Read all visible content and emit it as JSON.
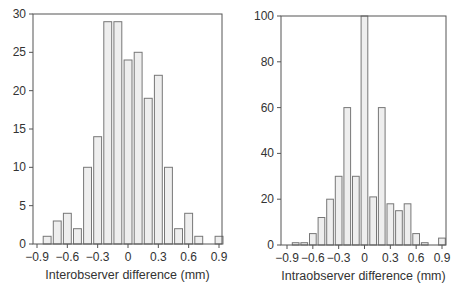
{
  "chart_data": [
    {
      "type": "bar",
      "title": "",
      "xlabel": "Interobserver difference (mm)",
      "ylabel": "",
      "ylim": [
        0,
        30
      ],
      "xlim": [
        -0.9,
        0.9
      ],
      "yticks": [
        0,
        5,
        10,
        15,
        20,
        25,
        30
      ],
      "xticks": [
        "-0.9",
        "-0.6",
        "-0.3",
        "0",
        "0.3",
        "0.6",
        "0.9"
      ],
      "categories": [
        -0.9,
        -0.8,
        -0.7,
        -0.6,
        -0.5,
        -0.4,
        -0.3,
        -0.2,
        -0.1,
        0,
        0.1,
        0.2,
        0.3,
        0.4,
        0.5,
        0.6,
        0.7,
        0.8,
        0.9
      ],
      "values": [
        0,
        1,
        3,
        4,
        2,
        10,
        14,
        29,
        29,
        24,
        25,
        19,
        22,
        10,
        2,
        4,
        1,
        0,
        1
      ],
      "grid": false,
      "legend": null
    },
    {
      "type": "bar",
      "title": "",
      "xlabel": "Intraobserver difference (mm)",
      "ylabel": "",
      "ylim": [
        0,
        100
      ],
      "xlim": [
        -0.9,
        0.9
      ],
      "yticks": [
        0,
        20,
        40,
        60,
        80,
        100
      ],
      "xticks": [
        "-0.9",
        "-0.6",
        "-0.3",
        "0",
        "0.3",
        "0.6",
        "0.9"
      ],
      "categories": [
        -0.9,
        -0.8,
        -0.7,
        -0.6,
        -0.5,
        -0.4,
        -0.3,
        -0.2,
        -0.1,
        0,
        0.1,
        0.2,
        0.3,
        0.4,
        0.5,
        0.6,
        0.7,
        0.8,
        0.9
      ],
      "values": [
        0,
        1,
        1,
        5,
        12,
        20,
        30,
        60,
        30,
        100,
        21,
        60,
        18,
        15,
        18,
        5,
        1,
        0,
        3
      ],
      "grid": false,
      "legend": null
    }
  ],
  "style": {
    "bar_fill": "#eeeeee",
    "bar_stroke": "#777777",
    "axis_color": "#555555"
  }
}
